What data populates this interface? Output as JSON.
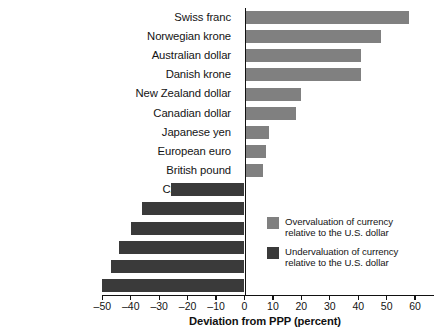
{
  "chart_data": {
    "type": "bar",
    "orientation": "horizontal",
    "title": "",
    "xlabel": "Deviation from PPP (percent)",
    "ylabel": "",
    "xlim": [
      -50,
      60
    ],
    "xticks": [
      -50,
      -40,
      -30,
      -20,
      -10,
      0,
      10,
      20,
      30,
      40,
      50,
      60
    ],
    "xtick_labels": [
      "–50",
      "–40",
      "–30",
      "–20",
      "–10",
      "0",
      "10",
      "20",
      "30",
      "40",
      "50",
      "60"
    ],
    "grid": false,
    "legend_position": "inside-lower-right",
    "categories": [
      "Swiss franc",
      "Norwegian krone",
      "Australian dollar",
      "Danish krone",
      "New Zealand dollar",
      "Canadian dollar",
      "Japanese yen",
      "European euro",
      "British pound",
      "Czech koruna",
      "Mexican peso",
      "Polish zloty",
      "Russian ruble",
      "South African rand",
      "Turkish lira"
    ],
    "values": [
      58,
      48,
      41,
      41,
      20,
      18,
      8.5,
      7.5,
      6.5,
      -26,
      -36,
      -40,
      -44,
      -47,
      -50
    ],
    "series": [
      {
        "name": "Deviation from PPP (percent)",
        "values": [
          58,
          48,
          41,
          41,
          20,
          18,
          8.5,
          7.5,
          6.5,
          -26,
          -36,
          -40,
          -44,
          -47,
          -50
        ]
      }
    ],
    "colors": {
      "overvaluation": "#808080",
      "undervaluation": "#3a3a3a",
      "axis": "#111111",
      "text": "#141414",
      "background": "#ffffff"
    },
    "legend": [
      {
        "swatch": "overvaluation",
        "label": "Overvaluation of currency\nrelative to the U.S. dollar"
      },
      {
        "swatch": "undervaluation",
        "label": "Undervaluation of currency\nrelative to the U.S. dollar"
      }
    ]
  }
}
